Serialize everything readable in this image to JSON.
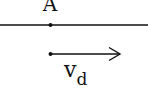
{
  "diagram": {
    "point_label": "A",
    "velocity_label": "v",
    "velocity_subscript": "d",
    "line_color": "#111111",
    "background": "#ffffff"
  }
}
